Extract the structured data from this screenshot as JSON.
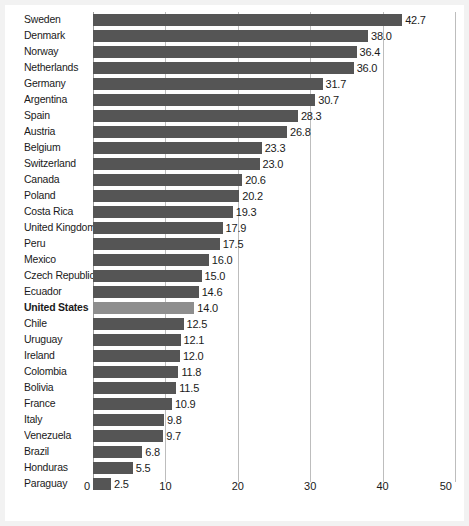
{
  "chart_data": {
    "type": "bar",
    "orientation": "horizontal",
    "title": "",
    "xlabel": "",
    "ylabel": "",
    "xlim": [
      0,
      50
    ],
    "xticks": [
      0,
      10,
      20,
      30,
      40,
      50
    ],
    "grid": true,
    "legend": "none",
    "highlight_category": "United States",
    "colors": {
      "bar": "#555555",
      "bar_highlight": "#8e8e8e",
      "gridline": "#bdbdbd",
      "axis": "#9a9a9a",
      "text": "#1a1a1a",
      "page_background": "#f2f2f2",
      "plot_background": "#ffffff"
    },
    "categories": [
      "Sweden",
      "Denmark",
      "Norway",
      "Netherlands",
      "Germany",
      "Argentina",
      "Spain",
      "Austria",
      "Belgium",
      "Switzerland",
      "Canada",
      "Poland",
      "Costa Rica",
      "United Kingdom",
      "Peru",
      "Mexico",
      "Czech Republic",
      "Ecuador",
      "United States",
      "Chile",
      "Uruguay",
      "Ireland",
      "Colombia",
      "Bolivia",
      "France",
      "Italy",
      "Venezuela",
      "Brazil",
      "Honduras",
      "Paraguay"
    ],
    "values": [
      42.7,
      38.0,
      36.4,
      36.0,
      31.7,
      30.7,
      28.3,
      26.8,
      23.3,
      23.0,
      20.6,
      20.2,
      19.3,
      17.9,
      17.5,
      16.0,
      15.0,
      14.6,
      14.0,
      12.5,
      12.1,
      12.0,
      11.8,
      11.5,
      10.9,
      9.8,
      9.7,
      6.8,
      5.5,
      2.5
    ],
    "value_labels": [
      "42.7",
      "38.0",
      "36.4",
      "36.0",
      "31.7",
      "30.7",
      "28.3",
      "26.8",
      "23.3",
      "23.0",
      "20.6",
      "20.2",
      "19.3",
      "17.9",
      "17.5",
      "16.0",
      "15.0",
      "14.6",
      "14.0",
      "12.5",
      "12.1",
      "12.0",
      "11.8",
      "11.5",
      "10.9",
      "9.8",
      "9.7",
      "6.8",
      "5.5",
      "2.5"
    ],
    "xtick_labels": [
      "0",
      "10",
      "20",
      "30",
      "40",
      "50"
    ]
  }
}
